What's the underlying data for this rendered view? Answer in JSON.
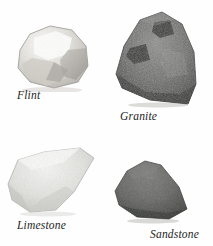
{
  "figure": {
    "background_color": "#fefefe",
    "specimens": [
      {
        "id": "flint",
        "label": "Flint",
        "icon_name": "rock-flint-photo",
        "colors": {
          "base": "#d9d7d2",
          "highlight": "#fbfbfa",
          "shadow": "#9d9a94",
          "outline": "#8d8a85"
        }
      },
      {
        "id": "granite",
        "label": "Granite",
        "icon_name": "rock-granite-photo",
        "colors": {
          "base": "#6e6f6d",
          "highlight": "#9a9b98",
          "shadow": "#3a3b39",
          "outline": "#2f302e"
        }
      },
      {
        "id": "limestone",
        "label": "Limestone",
        "icon_name": "rock-limestone-photo",
        "colors": {
          "base": "#dedfdb",
          "highlight": "#f4f4f2",
          "shadow": "#b3b4b0",
          "outline": "#a9aaa6"
        }
      },
      {
        "id": "sandstone",
        "label": "Sandstone",
        "icon_name": "rock-sandstone-photo",
        "colors": {
          "base": "#616260",
          "highlight": "#7d7e7b",
          "shadow": "#3d3e3c",
          "outline": "#343533"
        }
      }
    ]
  }
}
